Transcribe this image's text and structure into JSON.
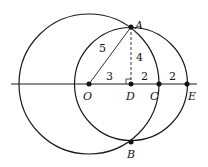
{
  "diagram": {
    "points": {
      "A": "A",
      "B": "B",
      "O": "O",
      "D": "D",
      "C": "C",
      "E": "E"
    },
    "lengths": {
      "OA": "5",
      "AD": "4",
      "OD": "3",
      "DC": "2",
      "CE": "2"
    },
    "colors": {
      "stroke": "#1a1a1a",
      "background": "#ffffff"
    }
  }
}
